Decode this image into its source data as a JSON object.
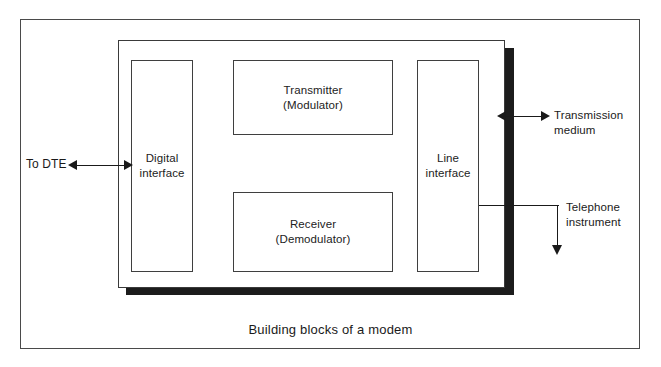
{
  "figure": {
    "caption": "Building blocks of a modem",
    "enclosure_name": "modem"
  },
  "blocks": [
    {
      "id": "digital-interface",
      "lines": [
        "Digital",
        "interface"
      ]
    },
    {
      "id": "transmitter",
      "lines": [
        "Transmitter",
        "(Modulator)"
      ]
    },
    {
      "id": "receiver",
      "lines": [
        "Receiver",
        "(Demodulator)"
      ]
    },
    {
      "id": "line-interface",
      "lines": [
        "Line",
        "interface"
      ]
    }
  ],
  "connectors": {
    "to_dte": {
      "label": "To DTE",
      "arrow": "double-headed",
      "icon_left": "arrow-left-icon",
      "icon_right": "arrow-right-icon"
    },
    "transmission_medium": {
      "label_line1": "Transmission",
      "label_line2": "medium",
      "arrow": "double-headed",
      "icon_left": "arrow-left-icon",
      "icon_right": "arrow-right-icon"
    },
    "telephone_instrument": {
      "label_line1": "Telephone",
      "label_line2": "instrument",
      "arrow": "single-headed-down",
      "icon_down": "arrow-down-icon"
    }
  },
  "colors": {
    "line": "#1a1a1a",
    "box_border": "#3f3f3f",
    "frame_border": "#4a4a4a",
    "shadow": "#1c1c1c",
    "background": "#ffffff",
    "text": "#222222"
  }
}
